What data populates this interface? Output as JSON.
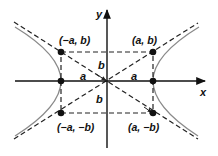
{
  "diagram": {
    "axes": {
      "x_label": "x",
      "y_label": "y"
    },
    "points": [
      {
        "id": "neg-a-pos-b",
        "label": "(−a, b)"
      },
      {
        "id": "pos-a-pos-b",
        "label": "(a, b)"
      },
      {
        "id": "neg-a-neg-b",
        "label": "(−a, −b)"
      },
      {
        "id": "pos-a-neg-b",
        "label": "(a, −b)"
      }
    ],
    "segment_labels": {
      "a_left": "a",
      "a_right": "a",
      "b_top": "b",
      "b_bottom": "b"
    },
    "colors": {
      "axes": "#111111",
      "dashed": "#222222",
      "curve": "#8a8a8a",
      "points": "#111111"
    }
  }
}
